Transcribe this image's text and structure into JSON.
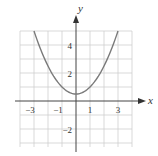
{
  "chart_data": {
    "type": "line",
    "title": "",
    "xlabel": "x",
    "ylabel": "y",
    "xlim": [
      -4,
      4
    ],
    "ylim": [
      -3,
      5
    ],
    "grid": true,
    "x_ticks": [
      "-3",
      "-1",
      "1",
      "3"
    ],
    "y_ticks": [
      "4",
      "2",
      "-2"
    ],
    "series": [
      {
        "name": "parabola",
        "equation": "y = 0.5x^2 + 0.5",
        "x": [
          -3,
          -2,
          -1,
          0,
          1,
          2,
          3
        ],
        "y": [
          5,
          2.5,
          1,
          0.5,
          1,
          2.5,
          5
        ],
        "color": "#7a7a7a"
      }
    ]
  },
  "labels": {
    "x_axis": "x",
    "y_axis": "y",
    "tick_x_m3": "−3",
    "tick_x_m1": "−1",
    "tick_x_1": "1",
    "tick_x_3": "3",
    "tick_y_4": "4",
    "tick_y_2": "2",
    "tick_y_m2": "−2"
  }
}
